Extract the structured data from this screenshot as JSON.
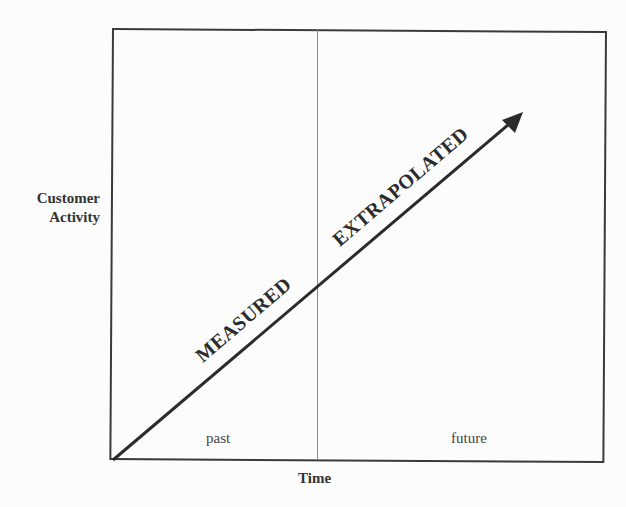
{
  "diagram": {
    "y_axis_label_line1": "Customer",
    "y_axis_label_line2": "Activity",
    "x_axis_label": "Time",
    "regions": [
      {
        "label": "past"
      },
      {
        "label": "future"
      }
    ],
    "segments": [
      {
        "label": "MEASURED"
      },
      {
        "label": "EXTRAPOLATED"
      }
    ],
    "colors": {
      "background": "#fcfcfc",
      "line": "#2b2b2b",
      "divider": "#8a8a8a"
    }
  }
}
